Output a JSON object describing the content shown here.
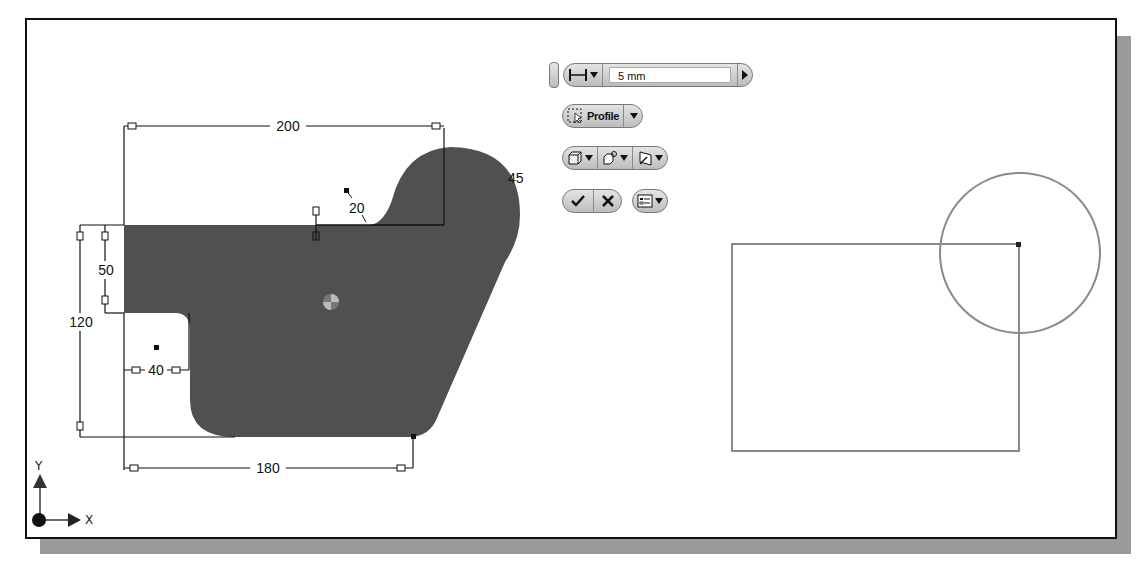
{
  "mini_toolbar": {
    "distance_value": "5 mm",
    "profile_label": "Profile",
    "distance_icon": "distance-extents-icon",
    "ok_icon": "checkmark-icon",
    "cancel_icon": "close-icon"
  },
  "sketch": {
    "dimensions": {
      "top_width": "200",
      "bottom_width": "180",
      "left_height": "120",
      "left_offset": "50",
      "notch_width": "40",
      "fillet_small": "20",
      "fillet_large": "45"
    }
  },
  "axis": {
    "x_label": "X",
    "y_label": "Y"
  }
}
